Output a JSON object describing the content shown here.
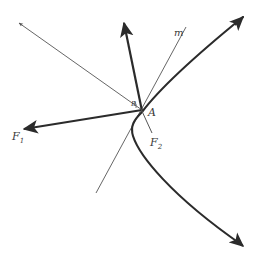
{
  "figure": {
    "type": "geometry-diagram",
    "background_color": "#ffffff",
    "stroke_color": "#2b2b2b",
    "thin_stroke_color": "#555555",
    "label_color": "#3a3a3a"
  },
  "labels": {
    "f1": "F",
    "f1_sub": "1",
    "f2": "F",
    "f2_sub": "2",
    "point_a": "A",
    "point_b": "B",
    "line_m": "m"
  },
  "geometry": {
    "point_a": {
      "x": 142,
      "y": 110
    },
    "curve_vertex": {
      "x": 131,
      "y": 126
    },
    "curve_upper_end": {
      "x": 243,
      "y": 17
    },
    "curve_lower_end": {
      "x": 242,
      "y": 245
    },
    "vector_f1_tip": {
      "x": 22,
      "y": 130
    },
    "vector_up_tip": {
      "x": 124,
      "y": 21
    },
    "ray_upper_left_tip": {
      "x": 19,
      "y": 23
    },
    "line_m_lower_end": {
      "x": 96,
      "y": 193
    },
    "line_m_upper_end": {
      "x": 186,
      "y": 27
    },
    "f2_segment_end": {
      "x": 152,
      "y": 132
    }
  },
  "label_positions": {
    "f1": {
      "x": 12,
      "y": 136
    },
    "f2": {
      "x": 150,
      "y": 144
    },
    "a": {
      "x": 148,
      "y": 114
    },
    "b": {
      "x": 133,
      "y": 106
    },
    "m": {
      "x": 176,
      "y": 35
    }
  }
}
